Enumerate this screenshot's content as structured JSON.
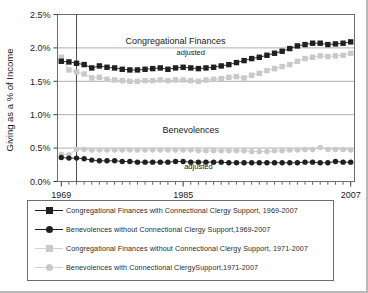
{
  "chart_data": {
    "type": "line",
    "title": "",
    "xlabel": "",
    "ylabel": "Giving as a % of Income",
    "xlim": [
      1968.5,
      2007.5
    ],
    "ylim": [
      0.0,
      2.5
    ],
    "ytick_labels": [
      "0.0%",
      "0.5%",
      "1.0%",
      "1.5%",
      "2.0%",
      "2.5%"
    ],
    "ytick_values": [
      0.0,
      0.5,
      1.0,
      1.5,
      2.0,
      2.5
    ],
    "xtick_labels": [
      "1969",
      "1985",
      "2007"
    ],
    "xtick_values": [
      1969,
      1985,
      2007
    ],
    "grid": "horizontal",
    "legend_position": "below-plot",
    "annotations": [
      {
        "text": "Congregational Finances",
        "x": 1984,
        "y": 2.06
      },
      {
        "text": "adjusted",
        "x": 1986,
        "y": 1.9
      },
      {
        "text": "Benevolences",
        "x": 1986,
        "y": 0.72
      },
      {
        "text": "adjusted",
        "x": 1987,
        "y": 0.18
      }
    ],
    "reference_line_x": 1971,
    "series": [
      {
        "name": "Congregational Finances with Connectional Clergy Support, 1969-2007",
        "marker": "square",
        "color": "#202020",
        "x": [
          1969,
          1970,
          1971,
          1972,
          1973,
          1974,
          1975,
          1976,
          1977,
          1978,
          1979,
          1980,
          1981,
          1982,
          1983,
          1984,
          1985,
          1986,
          1987,
          1988,
          1989,
          1990,
          1991,
          1992,
          1993,
          1994,
          1995,
          1996,
          1997,
          1998,
          1999,
          2000,
          2001,
          2002,
          2003,
          2004,
          2005,
          2006,
          2007
        ],
        "values": [
          1.8,
          1.79,
          1.77,
          1.75,
          1.7,
          1.73,
          1.71,
          1.7,
          1.68,
          1.67,
          1.67,
          1.68,
          1.69,
          1.7,
          1.68,
          1.7,
          1.71,
          1.7,
          1.69,
          1.7,
          1.71,
          1.73,
          1.75,
          1.78,
          1.81,
          1.84,
          1.86,
          1.89,
          1.92,
          1.95,
          1.99,
          2.03,
          2.05,
          2.07,
          2.07,
          2.05,
          2.06,
          2.07,
          2.09
        ]
      },
      {
        "name": "Congregational Finances without Connectional Clergy Support, 1971-2007",
        "marker": "square",
        "color": "#c9c9c9",
        "x": [
          1969,
          1970,
          1971,
          1972,
          1973,
          1974,
          1975,
          1976,
          1977,
          1978,
          1979,
          1980,
          1981,
          1982,
          1983,
          1984,
          1985,
          1986,
          1987,
          1988,
          1989,
          1990,
          1991,
          1992,
          1993,
          1994,
          1995,
          1996,
          1997,
          1998,
          1999,
          2000,
          2001,
          2002,
          2003,
          2004,
          2005,
          2006,
          2007
        ],
        "values": [
          1.86,
          1.67,
          1.64,
          1.61,
          1.55,
          1.56,
          1.53,
          1.52,
          1.51,
          1.5,
          1.5,
          1.51,
          1.51,
          1.52,
          1.51,
          1.52,
          1.52,
          1.51,
          1.5,
          1.52,
          1.53,
          1.54,
          1.56,
          1.57,
          1.55,
          1.59,
          1.62,
          1.66,
          1.69,
          1.72,
          1.75,
          1.8,
          1.84,
          1.86,
          1.88,
          1.87,
          1.88,
          1.89,
          1.92
        ]
      },
      {
        "name": "Benevolences without Connectional Clergy Support,1969-2007",
        "marker": "circle",
        "color": "#202020",
        "x": [
          1969,
          1970,
          1971,
          1972,
          1973,
          1974,
          1975,
          1976,
          1977,
          1978,
          1979,
          1980,
          1981,
          1982,
          1983,
          1984,
          1985,
          1986,
          1987,
          1988,
          1989,
          1990,
          1991,
          1992,
          1993,
          1994,
          1995,
          1996,
          1997,
          1998,
          1999,
          2000,
          2001,
          2002,
          2003,
          2004,
          2005,
          2006,
          2007
        ],
        "values": [
          0.36,
          0.35,
          0.35,
          0.34,
          0.32,
          0.31,
          0.31,
          0.31,
          0.3,
          0.3,
          0.29,
          0.29,
          0.29,
          0.29,
          0.29,
          0.3,
          0.3,
          0.29,
          0.29,
          0.29,
          0.29,
          0.29,
          0.28,
          0.28,
          0.28,
          0.28,
          0.28,
          0.28,
          0.28,
          0.28,
          0.28,
          0.28,
          0.29,
          0.29,
          0.28,
          0.28,
          0.3,
          0.29,
          0.29
        ]
      },
      {
        "name": "Benevolences with Connectional ClergySupport,1971-2007",
        "marker": "circle",
        "color": "#c9c9c9",
        "x": [
          1969,
          1970,
          1971,
          1972,
          1973,
          1974,
          1975,
          1976,
          1977,
          1978,
          1979,
          1980,
          1981,
          1982,
          1983,
          1984,
          1985,
          1986,
          1987,
          1988,
          1989,
          1990,
          1991,
          1992,
          1993,
          1994,
          1995,
          1996,
          1997,
          1998,
          1999,
          2000,
          2001,
          2002,
          2003,
          2004,
          2005,
          2006,
          2007
        ],
        "values": [
          0.41,
          0.4,
          0.48,
          0.48,
          0.47,
          0.47,
          0.47,
          0.47,
          0.47,
          0.47,
          0.47,
          0.47,
          0.47,
          0.47,
          0.47,
          0.47,
          0.47,
          0.47,
          0.46,
          0.46,
          0.46,
          0.46,
          0.46,
          0.46,
          0.46,
          0.45,
          0.45,
          0.45,
          0.46,
          0.46,
          0.47,
          0.47,
          0.48,
          0.48,
          0.51,
          0.48,
          0.48,
          0.48,
          0.47
        ]
      }
    ]
  },
  "legend": {
    "items": [
      {
        "label": "Congregational Finances with Connectional Clergy Support, 1969-2007",
        "marker": "square",
        "tone": "dark"
      },
      {
        "label": "Benevolences without Connectional Clergy Support,1969-2007",
        "marker": "circle",
        "tone": "dark"
      },
      {
        "label": "Congregational Finances without Connectional Clergy Support, 1971-2007",
        "marker": "square",
        "tone": "light"
      },
      {
        "label": "Benevolences with Connectional ClergySupport,1971-2007",
        "marker": "circle",
        "tone": "light"
      }
    ]
  },
  "colors": {
    "dark_series": "#202020",
    "light_series": "#c9c9c9",
    "grid": "#9a9a9a",
    "axis": "#3a3a3a",
    "frame": "#6d6d6d"
  }
}
